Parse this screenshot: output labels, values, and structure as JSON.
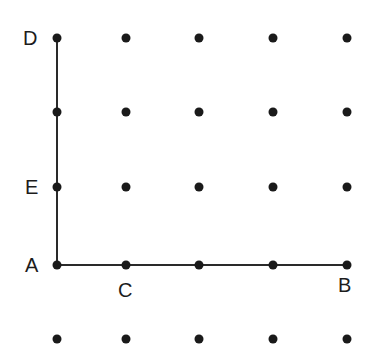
{
  "diagram": {
    "type": "dot-grid",
    "rows": 5,
    "cols": 5,
    "columns_x": [
      57,
      126,
      199,
      273,
      347
    ],
    "rows_y": [
      38,
      112,
      187,
      265,
      339
    ],
    "dot_color": "#1a1a1a",
    "line_color": "#2a2a2a",
    "segments": [
      {
        "from": "A",
        "to": "D",
        "name": "segment-AD"
      },
      {
        "from": "A",
        "to": "B",
        "name": "segment-AB"
      }
    ],
    "points": {
      "A": {
        "label": "A",
        "col": 0,
        "row": 3
      },
      "B": {
        "label": "B",
        "col": 4,
        "row": 3
      },
      "C": {
        "label": "C",
        "col": 1,
        "row": 3
      },
      "D": {
        "label": "D",
        "col": 0,
        "row": 0
      },
      "E": {
        "label": "E",
        "col": 0,
        "row": 2
      }
    }
  }
}
